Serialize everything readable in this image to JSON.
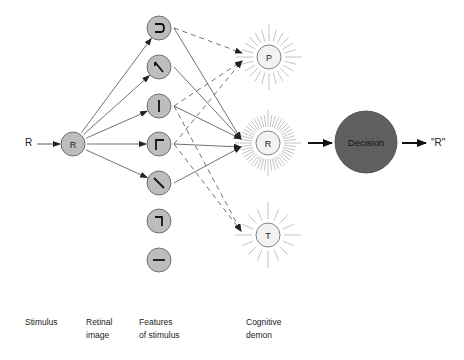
{
  "stimulus": {
    "letter": "R"
  },
  "retinal_image": {
    "letter": "R"
  },
  "features": [
    {
      "id": "curve",
      "glyph": "⊃"
    },
    {
      "id": "diag-up",
      "glyph": "∧-left"
    },
    {
      "id": "vertical",
      "glyph": "|"
    },
    {
      "id": "corner-tl",
      "glyph": "Γ"
    },
    {
      "id": "diag-down",
      "glyph": "\\"
    },
    {
      "id": "corner-tr",
      "glyph": "¬"
    },
    {
      "id": "horizontal",
      "glyph": "—"
    }
  ],
  "demons": [
    {
      "letter": "P",
      "rays": 24
    },
    {
      "letter": "R",
      "rays": 48
    },
    {
      "letter": "T",
      "rays": 16
    }
  ],
  "decision": {
    "label": "Decision"
  },
  "output": {
    "label": "\"R\""
  },
  "labels": {
    "stimulus": "Stimulus",
    "retinal": "Retinal\nimage",
    "features": "Features\nof stimulus",
    "demon": "Cognitive\ndemon"
  },
  "colors": {
    "feature_fill": "#bdbdbd",
    "demon_fill": "#f2f2f2",
    "decision_fill": "#5f5f5f",
    "ray": "#9a9a9a",
    "line": "#333333"
  },
  "connections": {
    "solid": [
      [
        0,
        1
      ],
      [
        1,
        1
      ],
      [
        2,
        1
      ],
      [
        3,
        1
      ],
      [
        4,
        1
      ]
    ],
    "dashed": [
      [
        0,
        0
      ],
      [
        2,
        0
      ],
      [
        3,
        0
      ],
      [
        2,
        2
      ],
      [
        3,
        2
      ]
    ]
  }
}
